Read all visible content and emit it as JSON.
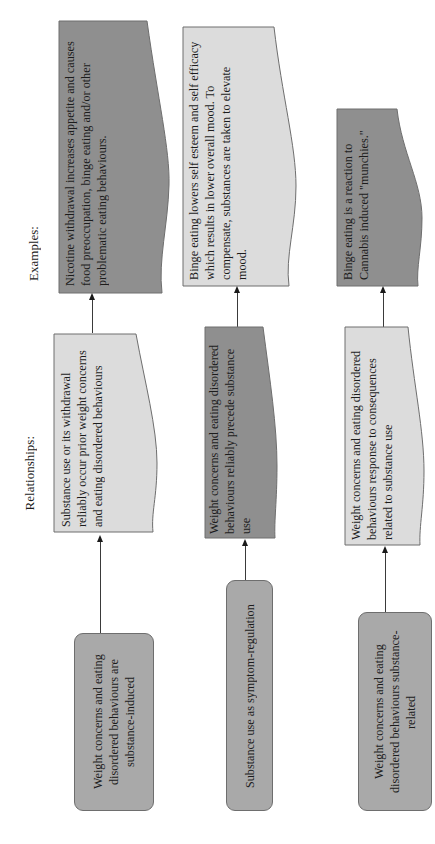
{
  "headers": {
    "examples": "Examples:",
    "relationships": "Relationships:"
  },
  "rows": [
    {
      "category": "Weight concerns and eating disordered behaviours are substance-induced",
      "relationship": "Substance use or its withdrawal reliably occur prior weight concerns and eating disordered behaviours",
      "example": "Nicotine withdrawal increases appetite and causes food preoccupation, binge eating and/or other problematic eating behaviours."
    },
    {
      "category": "Substance use as symptom-regulation",
      "relationship": "Weight concerns and eating disordered behaviours reliably precede substance use",
      "example": "Binge eating lowers self esteem and self efficacy which results in lower overall mood. To compensate, substances are taken to elevate mood."
    },
    {
      "category": "Weight concerns and eating disordered behaviours substance-related",
      "relationship": "Weight concerns and eating disordered behaviours response to consequences related to substance use",
      "example": "Binge eating is a reaction to Cannabis induced \"munchies.\""
    }
  ],
  "colors": {
    "dark_fill": "#8f8f8f",
    "light_fill": "#dcdcdc",
    "category_fill": "#a9a9a9",
    "stroke": "#6e6e6e",
    "arrow": "#3a3a3a"
  },
  "orientation": "rotated 90 degrees counter-clockwise"
}
